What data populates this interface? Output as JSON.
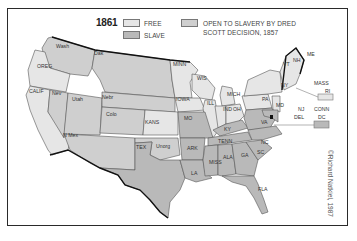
{
  "map": {
    "year": "1861",
    "credit": "©Richard Natkiel, 1987",
    "legend": [
      {
        "key": "free",
        "label": "FREE",
        "color": "#e6e6e6"
      },
      {
        "key": "slave",
        "label": "SLAVE",
        "color": "#b9b9b9"
      },
      {
        "key": "open",
        "label_line1": "OPEN TO SLAVERY BY DRED",
        "label_line2": "SCOTT DECISION, 1857",
        "color": "#cfcfcf"
      }
    ],
    "colors": {
      "free": "#e6e6e6",
      "slave": "#b9b9b9",
      "open": "#cfcfcf",
      "border": "#555555",
      "coast": "#111111"
    },
    "state_labels": {
      "wash": "Wash",
      "oreg": "OREG",
      "calif": "CALIF",
      "nev": "Nev",
      "utah": "Utah",
      "dak": "Dak",
      "nebr": "Nebr",
      "colo": "Colo",
      "nmex": "N Mex",
      "kans": "KANS",
      "tex": "TEX",
      "unorg": "Unorg",
      "minn": "MINN",
      "iowa": "IOWA",
      "wis": "WIS",
      "ill": "ILL",
      "mich": "MICH",
      "ind": "IND",
      "oh": "OH",
      "mo": "MO",
      "ark": "ARK",
      "la": "LA",
      "ky": "KY",
      "tenn": "TENN",
      "miss": "MISS",
      "ala": "ALA",
      "ga": "GA",
      "sc": "SC",
      "nc": "NC",
      "fla": "FLA",
      "va": "VA",
      "pa": "PA",
      "md": "MD",
      "ny": "NY",
      "vt": "VT",
      "nh": "NH",
      "me": "ME",
      "mass": "MASS",
      "ri": "RI",
      "conn": "CONN",
      "nj": "NJ",
      "del": "DEL",
      "dc": "DC"
    }
  }
}
